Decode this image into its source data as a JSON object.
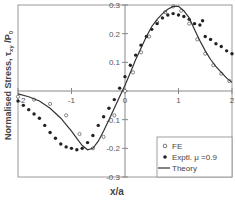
{
  "chart_data": {
    "type": "line",
    "title": "",
    "xlabel": "x/a",
    "ylabel": "Normalised Stress, τxy /P₀",
    "ylabel_parts": {
      "main": "Normalised Stress, τ",
      "sub": "xy",
      "after": " /P",
      "sub2": "0"
    },
    "xlim": [
      -2,
      2
    ],
    "ylim": [
      -0.3,
      0.3
    ],
    "x_ticks": [
      -2,
      -1,
      0,
      1,
      2
    ],
    "x_tick_labels": [
      "-2",
      "-1",
      "0",
      "1",
      "2"
    ],
    "y_ticks": [
      -0.3,
      -0.2,
      -0.1,
      0,
      0.1,
      0.2,
      0.3
    ],
    "y_tick_labels": [
      "-0.3",
      "-0.2",
      "-0.1",
      "0",
      "0.1",
      "0.2",
      "0.3"
    ],
    "grid": false,
    "legend_position": "bottom-right",
    "series": [
      {
        "name": "FE",
        "style": "open-circle-markers",
        "x": [
          -2.0,
          -1.7,
          -1.4,
          -1.1,
          -0.85,
          -0.6,
          -0.4,
          -0.2,
          0.0,
          0.15,
          0.3,
          0.45,
          0.6,
          0.75,
          0.9,
          1.05,
          1.2,
          1.35,
          1.5,
          1.65,
          1.8,
          1.95
        ],
        "y": [
          -0.02,
          -0.03,
          -0.045,
          -0.085,
          -0.15,
          -0.2,
          -0.16,
          -0.085,
          0.0,
          0.065,
          0.135,
          0.19,
          0.24,
          0.275,
          0.295,
          0.28,
          0.235,
          0.18,
          0.13,
          0.09,
          0.06,
          0.035
        ]
      },
      {
        "name": "Exptl. μ =0.9",
        "style": "filled-circle-markers",
        "x": [
          -2.0,
          -1.9,
          -1.8,
          -1.7,
          -1.6,
          -1.5,
          -1.4,
          -1.3,
          -1.2,
          -1.1,
          -1.0,
          -0.9,
          -0.8,
          -0.7,
          -0.6,
          -0.5,
          -0.4,
          -0.3,
          -0.2,
          -0.1,
          0.0,
          0.1,
          0.2,
          0.3,
          0.4,
          0.5,
          0.6,
          0.7,
          0.8,
          0.9,
          1.0,
          1.1,
          1.2,
          1.3,
          1.4,
          1.45,
          1.5,
          1.6,
          1.7,
          1.8,
          1.9,
          2.0
        ],
        "y": [
          -0.035,
          -0.05,
          -0.065,
          -0.08,
          -0.095,
          -0.12,
          -0.145,
          -0.165,
          -0.185,
          -0.195,
          -0.2,
          -0.205,
          -0.2,
          -0.18,
          -0.155,
          -0.12,
          -0.09,
          -0.06,
          -0.03,
          0.01,
          0.05,
          0.09,
          0.125,
          0.16,
          0.19,
          0.215,
          0.235,
          0.255,
          0.265,
          0.27,
          0.265,
          0.26,
          0.25,
          0.235,
          0.23,
          0.245,
          0.19,
          0.18,
          0.165,
          0.155,
          0.14,
          0.13
        ]
      },
      {
        "name": "Theory",
        "style": "solid-line",
        "x": [
          -2.0,
          -1.8,
          -1.6,
          -1.4,
          -1.2,
          -1.0,
          -0.9,
          -0.8,
          -0.7,
          -0.6,
          -0.5,
          -0.4,
          -0.3,
          -0.2,
          -0.1,
          0.0,
          0.1,
          0.2,
          0.3,
          0.4,
          0.5,
          0.6,
          0.7,
          0.8,
          0.9,
          1.0,
          1.1,
          1.2,
          1.3,
          1.4,
          1.5,
          1.6,
          1.7,
          1.8,
          1.9,
          2.0
        ],
        "y": [
          -0.01,
          -0.02,
          -0.035,
          -0.06,
          -0.095,
          -0.14,
          -0.165,
          -0.19,
          -0.205,
          -0.2,
          -0.175,
          -0.14,
          -0.1,
          -0.06,
          -0.02,
          0.02,
          0.065,
          0.11,
          0.15,
          0.19,
          0.225,
          0.25,
          0.27,
          0.285,
          0.295,
          0.295,
          0.28,
          0.255,
          0.215,
          0.175,
          0.14,
          0.11,
          0.085,
          0.065,
          0.045,
          0.03
        ]
      }
    ],
    "legend": [
      {
        "label": "FE",
        "marker": "open-circle"
      },
      {
        "label": "Exptl. μ  =0.9",
        "marker": "filled-circle"
      },
      {
        "label": "Theory",
        "marker": "line"
      }
    ]
  }
}
